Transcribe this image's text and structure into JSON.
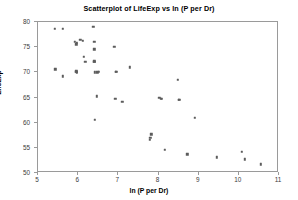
{
  "chart_data": {
    "type": "scatter",
    "title": "Scatterplot of LifeExp vs ln (P per Dr)",
    "xlabel": "ln (P per Dr)",
    "ylabel": "LifeExp",
    "xlim": [
      5,
      11
    ],
    "ylim": [
      50,
      80
    ],
    "xticks": [
      5,
      6,
      7,
      8,
      9,
      10,
      11
    ],
    "yticks": [
      50,
      55,
      60,
      65,
      70,
      75,
      80
    ],
    "grid": false,
    "legend": null,
    "marker_color": "#5c5c5c",
    "axis_color": "#9a9a9a",
    "series": [
      {
        "name": "Countries",
        "x": [
          5.42,
          5.62,
          5.43,
          5.62,
          5.92,
          5.95,
          5.97,
          5.95,
          5.95,
          5.97,
          6.05,
          6.12,
          6.14,
          6.18,
          6.38,
          6.4,
          6.4,
          6.4,
          6.4,
          6.42,
          6.42,
          6.46,
          6.48,
          6.52,
          6.9,
          6.93,
          6.95,
          6.92,
          7.1,
          7.28,
          7.78,
          7.8,
          7.82,
          8.02,
          8.06,
          8.08,
          8.16,
          8.48,
          8.5,
          8.52,
          8.72,
          8.9,
          9.45,
          10.08,
          10.15,
          10.55
        ],
        "y": [
          78.6,
          78.6,
          70.6,
          69.2,
          76.1,
          75.6,
          75.9,
          70.2,
          70.1,
          69.9,
          76.5,
          76.3,
          73.1,
          72.1,
          79.1,
          76.1,
          74.6,
          72.2,
          72.1,
          70.0,
          60.6,
          65.2,
          70.0,
          70.1,
          75.1,
          70.1,
          70.1,
          64.7,
          64.1,
          71.0,
          56.6,
          57.0,
          57.7,
          64.9,
          64.8,
          64.7,
          54.6,
          68.5,
          64.5,
          64.6,
          53.7,
          61.0,
          53.1,
          54.2,
          52.7,
          51.7
        ]
      }
    ]
  }
}
